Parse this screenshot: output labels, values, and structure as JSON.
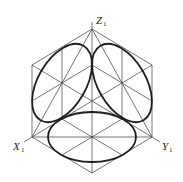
{
  "diagram": {
    "axes": [
      {
        "name": "Z",
        "subscript": "1",
        "label": "Z1"
      },
      {
        "name": "X",
        "subscript": "1",
        "label": "X1"
      },
      {
        "name": "Y",
        "subscript": "1",
        "label": "Y1"
      }
    ],
    "shapes": {
      "hexagon": "isometric cube outline",
      "ellipses": [
        "left face ellipse",
        "right face ellipse",
        "top/bottom face ellipse"
      ]
    },
    "colors": {
      "line": "#3a3a3a",
      "ellipse": "#1e1e1e",
      "background": "#ffffff"
    }
  }
}
